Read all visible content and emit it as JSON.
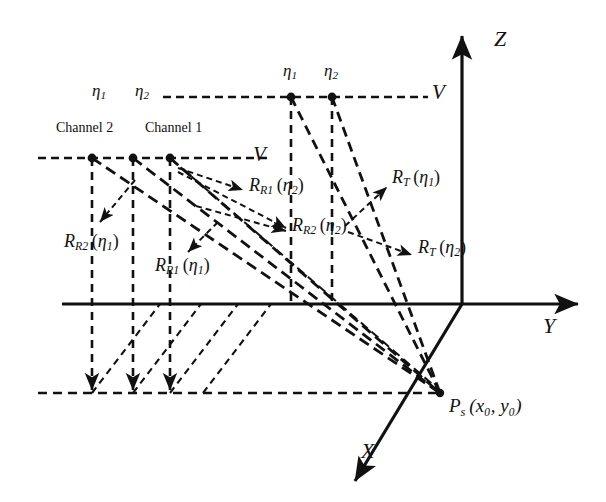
{
  "figure": {
    "kind": "bistatic-sar-geometry-diagram",
    "background": "#ffffff",
    "line_color": "#111111",
    "axes": {
      "z_label": "Z",
      "y_label": "Y",
      "x_label": "X",
      "origin_px": [
        462,
        304
      ]
    },
    "labels": {
      "eta1": "η",
      "eta1_sub": "1",
      "eta2": "η",
      "eta2_sub": "2",
      "channel2": "Channel 2",
      "channel1": "Channel 1",
      "velocity_top": "V",
      "velocity_mid": "V",
      "R_T_eta1": {
        "base": "R",
        "sub": "T",
        "arg": "η",
        "argsub": "1"
      },
      "R_T_eta2": {
        "base": "R",
        "sub": "T",
        "arg": "η",
        "argsub": "2"
      },
      "R_R1_eta2": {
        "base": "R",
        "sub": "R1",
        "arg": "η",
        "argsub": "2"
      },
      "R_R2_eta2": {
        "base": "R",
        "sub": "R2",
        "arg": "η",
        "argsub": "2"
      },
      "R_R2_eta1": {
        "base": "R",
        "sub": "R2",
        "arg": "η",
        "argsub": "1"
      },
      "R_R1_eta1": {
        "base": "R",
        "sub": "R1",
        "arg": "η",
        "argsub": "1"
      },
      "target": {
        "base": "P",
        "sub": "s",
        "args": "(x₀, y₀)"
      }
    },
    "geometry": {
      "transmitter_track_y": 97,
      "receiver_track_y": 158,
      "ground_line_y": 393,
      "transmitter_points_x": [
        291,
        332
      ],
      "receiver_points_x": [
        92,
        133,
        170
      ],
      "target_point": [
        440,
        393
      ]
    }
  }
}
